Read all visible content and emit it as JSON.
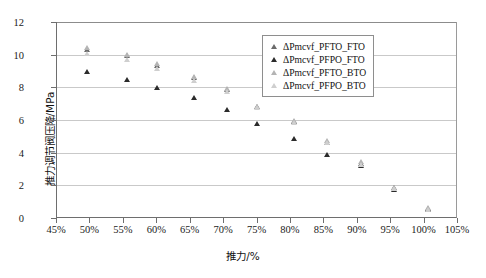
{
  "chart_data": {
    "type": "scatter",
    "title": "",
    "xlabel": "推力/%",
    "ylabel": "推力调节阀压降/MPa",
    "xlim": [
      45,
      105
    ],
    "ylim": [
      0,
      12
    ],
    "xticks": [
      "45%",
      "50%",
      "55%",
      "60%",
      "65%",
      "70%",
      "75%",
      "80%",
      "85%",
      "90%",
      "95%",
      "100%",
      "105%"
    ],
    "xtick_values": [
      45,
      50,
      55,
      60,
      65,
      70,
      75,
      80,
      85,
      90,
      95,
      100,
      105
    ],
    "yticks": [
      "0",
      "2",
      "4",
      "6",
      "8",
      "10",
      "12"
    ],
    "ytick_values": [
      0,
      2,
      4,
      6,
      8,
      10,
      12
    ],
    "grid": true,
    "grid_axis": "y",
    "legend_position": "top-right",
    "x": [
      49,
      55,
      59.5,
      65,
      70,
      74.5,
      80,
      85,
      90,
      95,
      100
    ],
    "series": [
      {
        "name": "ΔPmcvf_PFTO_FTO",
        "marker": "triangle",
        "color": "#6b6b6b",
        "values": [
          10.5,
          10.1,
          9.5,
          8.75,
          8.05,
          6.95,
          6.05,
          4.8,
          3.5,
          2.0,
          0.72
        ]
      },
      {
        "name": "ΔPmcvf_PFPO_FTO",
        "marker": "triangle",
        "color": "#2b2b2b",
        "values": [
          9.1,
          8.65,
          8.15,
          7.55,
          6.8,
          5.95,
          5.0,
          4.05,
          3.35,
          1.9,
          0.65
        ]
      },
      {
        "name": "ΔPmcvf_PFTO_BTO",
        "marker": "triangle",
        "color": "#b4b4b4",
        "values": [
          10.6,
          10.15,
          9.6,
          8.8,
          8.1,
          7.0,
          6.1,
          4.9,
          3.6,
          2.05,
          0.78
        ]
      },
      {
        "name": "ΔPmcvf_PFPO_BTO",
        "marker": "triangle",
        "color": "#cfcfcf",
        "values": [
          10.25,
          9.85,
          9.3,
          8.6,
          7.9,
          6.9,
          6.0,
          4.75,
          3.45,
          1.95,
          0.7
        ]
      }
    ]
  },
  "legend": {
    "items": [
      {
        "label": "ΔPmcvf_PFTO_FTO",
        "swatch": "triangle-marker-icon",
        "tone": "tri-mid"
      },
      {
        "label": "ΔPmcvf_PFPO_FTO",
        "swatch": "triangle-marker-icon",
        "tone": "tri-dark"
      },
      {
        "label": "ΔPmcvf_PFTO_BTO",
        "swatch": "triangle-marker-icon",
        "tone": "tri-light"
      },
      {
        "label": "ΔPmcvf_PFPO_BTO",
        "swatch": "triangle-marker-icon",
        "tone": "tri-pale"
      }
    ]
  }
}
